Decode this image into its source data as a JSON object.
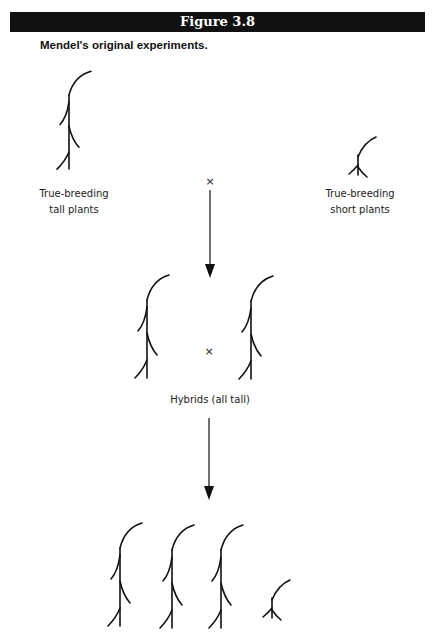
{
  "figure": {
    "title": "Figure 3.8",
    "caption": "Mendel's original experiments."
  },
  "parents": {
    "tall_label_line1": "True-breeding",
    "tall_label_line2": "tall plants",
    "short_label_line1": "True-breeding",
    "short_label_line2": "short plants",
    "cross_symbol": "×"
  },
  "f1": {
    "label": "Hybrids (all tall)",
    "cross_symbol": "×"
  },
  "f2": {
    "tall_count": 3,
    "short_count": 1
  },
  "colors": {
    "header_bg": "#111111",
    "header_text": "#ffffff",
    "ink": "#111111"
  }
}
